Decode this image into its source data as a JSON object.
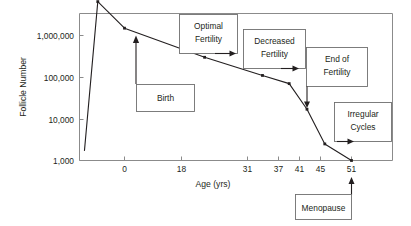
{
  "chart_data": {
    "type": "line",
    "title": "",
    "xlabel": "Age (yrs)",
    "ylabel": "Follicle Number",
    "yscale": "log",
    "ylim": [
      1000,
      10000000
    ],
    "xlim": [
      -9,
      51
    ],
    "grid": false,
    "legend": "none",
    "ytick_labels": [
      "1,000,000",
      "100,000",
      "10,000",
      "1,000"
    ],
    "ytick_values": [
      1000000,
      100000,
      10000,
      1000
    ],
    "xtick_labels": [
      "0",
      "18",
      "31",
      "37",
      "41",
      "45",
      "51"
    ],
    "xtick_values": [
      0,
      18,
      31,
      37,
      41,
      45,
      51
    ],
    "series": [
      {
        "name": "Follicle Number",
        "x": [
          -9,
          -6,
          0,
          18,
          31,
          37,
          41,
          45,
          51
        ],
        "y": [
          1700,
          6500000,
          1500000,
          300000,
          110000,
          70000,
          17000,
          2500,
          1000
        ]
      }
    ],
    "annotations": [
      {
        "label_line1": "Birth",
        "label_line2": "",
        "arrow": "up",
        "points_to_x": 0,
        "points_to_y": 1500000
      },
      {
        "label_line1": "Optimal",
        "label_line2": "Fertility",
        "arrow": "right",
        "points_to_x": 31,
        "points_to_y": 110000
      },
      {
        "label_line1": "Decreased",
        "label_line2": "Fertility",
        "arrow": "right",
        "points_to_x": 37,
        "points_to_y": 70000
      },
      {
        "label_line1": "End of",
        "label_line2": "Fertility",
        "arrow": "down",
        "points_to_x": 41,
        "points_to_y": 17000
      },
      {
        "label_line1": "Irregular",
        "label_line2": "Cycles",
        "arrow": "right",
        "points_to_x": 45,
        "points_to_y": 2500
      },
      {
        "label_line1": "Menopause",
        "label_line2": "",
        "arrow": "up",
        "points_to_x": 51,
        "points_to_y": 1000
      }
    ]
  },
  "colors": {
    "line": "#231f20",
    "frame": "#8b8b8b",
    "box_border": "#6f6f6f",
    "background": "#ffffff",
    "text": "#231f20"
  },
  "axis": {
    "x_title": "Age (yrs)",
    "y_title": "Follicle Number",
    "xticks": [
      "0",
      "18",
      "31",
      "37",
      "41",
      "45",
      "51"
    ],
    "yticks": [
      "1,000,000",
      "100,000",
      "10,000",
      "1,000"
    ]
  },
  "callouts": {
    "birth": "Birth",
    "optimal_1": "Optimal",
    "optimal_2": "Fertility",
    "decreased_1": "Decreased",
    "decreased_2": "Fertility",
    "end_1": "End of",
    "end_2": "Fertility",
    "irregular_1": "Irregular",
    "irregular_2": "Cycles",
    "menopause": "Menopause"
  }
}
